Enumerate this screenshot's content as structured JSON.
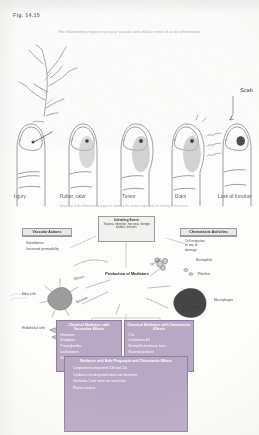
{
  "figure": {
    "number": "Fig. 14.15",
    "top_caption": "The inflammatory response to injury: vascular and cellular events of acute inflammation.",
    "mid_caption": "Sequence of the inflammatory response showing the cardinal signs and the healing of the wound."
  },
  "stages": {
    "scab_label": "Scab",
    "items": [
      {
        "label": "Injury"
      },
      {
        "label": "Rubor, calor"
      },
      {
        "label": "Tumor"
      },
      {
        "label": "Dolor"
      },
      {
        "label": "Loss of function"
      }
    ]
  },
  "flowchart": {
    "initiating": {
      "title": "Initiating Event",
      "detail": "Trauma, infection, necrosis, foreign bodies, irritants"
    },
    "hub": "Production of Mediators",
    "vascular": {
      "title": "Vascular Actions",
      "items": [
        "Vasodilation",
        "Increased permeability"
      ]
    },
    "chemotactic": {
      "title": "Chemotactic Activities",
      "items": [
        "Cell migration",
        "to site of",
        "damage"
      ]
    },
    "cells": [
      {
        "label": "Neutrophils"
      },
      {
        "label": "Platelets"
      },
      {
        "label": "Macrophages"
      },
      {
        "label": "Mast cells"
      },
      {
        "label": "Endothelial cells"
      },
      {
        "label": "Basophils"
      }
    ],
    "arrows": [
      {
        "label": "Release"
      },
      {
        "label": "Activation"
      },
      {
        "label": "Secretion"
      }
    ],
    "mediators_vasoactive": {
      "title": "Chemical Mediators with Vasoactive Effects",
      "items": [
        "Histamine",
        "Bradykinin",
        "Prostaglandins",
        "Leukotrienes",
        "Serotonin"
      ]
    },
    "mediators_chemotactic": {
      "title": "Chemical Mediators with Chemotactic Effects",
      "items": [
        "C5a",
        "Leukotriene B4",
        "Neutrophil chemotactic factor",
        "Bacterial products"
      ]
    },
    "mediators_both": {
      "title": "Mediators with Both Phagocytic and Chemotactic Effects",
      "items": [
        "Complement components C3b and C5a",
        "Cytokines including interleukins and interferons",
        "Interleukin-1 and tumor necrosis factor",
        "Plasma proteins"
      ]
    }
  }
}
